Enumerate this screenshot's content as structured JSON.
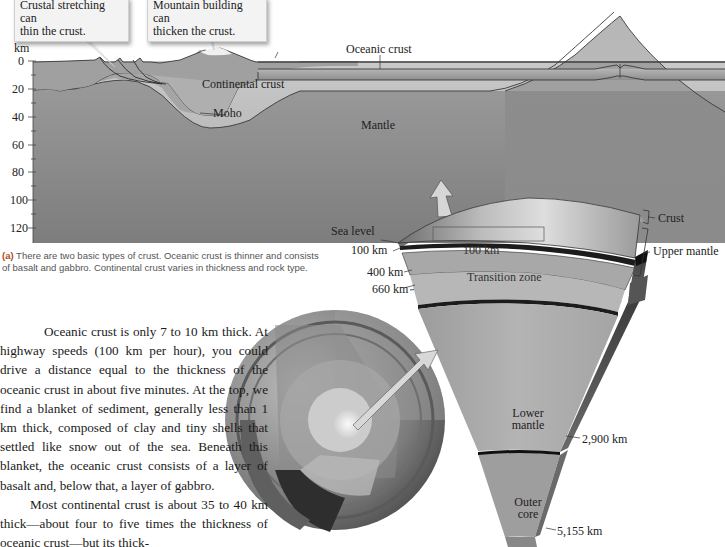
{
  "figure": {
    "callouts": [
      {
        "id": "stretching",
        "text_line1": "Crustal stretching can",
        "text_line2": "thin the crust."
      },
      {
        "id": "mountain",
        "text_line1": "Mountain building can",
        "text_line2": "thicken the crust."
      }
    ],
    "cross_section": {
      "axis_unit": "km",
      "depth_ticks": [
        "0",
        "20",
        "40",
        "60",
        "80",
        "100",
        "120"
      ],
      "labels": {
        "oceanic_crust": "Oceanic crust",
        "continental_crust": "Continental crust",
        "moho": "Moho",
        "mantle": "Mantle"
      },
      "colors": {
        "crust": "#a9a9a9",
        "mantle": "#bdbdbd",
        "lithosphere_root": "#8f8f8f",
        "ridge": "#8a8a8a"
      }
    },
    "caption": {
      "tag": "(a)",
      "text": " There are two basic types of crust. Oceanic crust is thinner and consists of basalt and gabbro. Continental crust varies in thickness and rock type."
    },
    "earth_wedge": {
      "labels": {
        "sea_level": "Sea level",
        "depth_100": "100 km",
        "scale_100": "100 km",
        "depth_400": "400 km",
        "transition_zone": "Transition zone",
        "depth_660": "660 km",
        "crust": "Crust",
        "upper_mantle": "Upper mantle",
        "lower_mantle_1": "Lower",
        "lower_mantle_2": "mantle",
        "depth_2900": "2,900 km",
        "outer_core_1": "Outer",
        "outer_core_2": "core",
        "depth_5155": "5,155 km"
      }
    }
  },
  "body_text": {
    "paragraphs": [
      "Oceanic crust is only 7 to 10 km thick. At highway speeds (100 km per hour), you could drive a distance equal to the thickness of the oceanic crust in about five minutes. At the top, we find a blanket of sediment, generally less than 1 km thick, composed of clay and tiny shells that settled like snow out of the sea. Beneath this blanket, the oceanic crust consists of a layer of basalt and, below that, a layer of gabbro.",
      "Most continental crust is about 35 to 40 km thick—about four to five times the thickness of oceanic crust—but its thick-"
    ]
  }
}
